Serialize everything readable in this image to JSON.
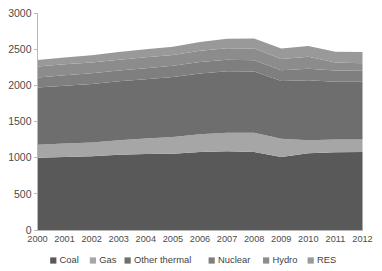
{
  "chart_data": {
    "type": "area",
    "stacked": true,
    "title": "",
    "subtitle": "",
    "xlabel": "",
    "ylabel": "",
    "grid": false,
    "legend_position": "bottom",
    "categories": [
      "2000",
      "2001",
      "2002",
      "2003",
      "2004",
      "2005",
      "2006",
      "2007",
      "2008",
      "2009",
      "2010",
      "2011",
      "2012"
    ],
    "x": [
      2000,
      2001,
      2002,
      2003,
      2004,
      2005,
      2006,
      2007,
      2008,
      2009,
      2010,
      2011,
      2012
    ],
    "xlim": [
      2000,
      2012
    ],
    "ylim": [
      0,
      3000
    ],
    "ytick_labels": [
      "0",
      "500",
      "1000",
      "1500",
      "2000",
      "2500",
      "3000"
    ],
    "yticks": [
      0,
      500,
      1000,
      1500,
      2000,
      2500,
      3000
    ],
    "series": [
      {
        "name": "Coal",
        "color": "#595959",
        "values": [
          1000,
          1010,
          1020,
          1040,
          1050,
          1055,
          1080,
          1090,
          1080,
          1010,
          1060,
          1075,
          1080
        ]
      },
      {
        "name": "Gas",
        "color": "#a6a6a6",
        "values": [
          180,
          185,
          190,
          200,
          215,
          230,
          245,
          255,
          265,
          250,
          180,
          175,
          170
        ]
      },
      {
        "name": "Other thermal",
        "color": "#6e6e6e",
        "values": [
          790,
          800,
          810,
          815,
          820,
          830,
          840,
          850,
          845,
          800,
          830,
          800,
          800
        ]
      },
      {
        "name": "Nuclear",
        "color": "#7f7f7f",
        "values": [
          140,
          145,
          148,
          150,
          152,
          155,
          158,
          160,
          158,
          150,
          160,
          155,
          150
        ]
      },
      {
        "name": "Hydro",
        "color": "#8c8c8c",
        "values": [
          150,
          150,
          148,
          150,
          152,
          150,
          155,
          158,
          160,
          155,
          165,
          110,
          105
        ]
      },
      {
        "name": "RES",
        "color": "#999999",
        "values": [
          90,
          95,
          100,
          105,
          110,
          115,
          120,
          130,
          140,
          145,
          150,
          150,
          155
        ]
      }
    ],
    "totals": [
      2350,
      2385,
      2416,
      2460,
      2499,
      2535,
      2598,
      2643,
      2648,
      2510,
      2545,
      2465,
      2460
    ]
  },
  "legend": {
    "items": [
      {
        "label": "Coal",
        "color": "#595959"
      },
      {
        "label": "Gas",
        "color": "#a6a6a6"
      },
      {
        "label": "Other thermal",
        "color": "#6e6e6e"
      },
      {
        "label": "Nuclear",
        "color": "#7f7f7f"
      },
      {
        "label": "Hydro",
        "color": "#8c8c8c"
      },
      {
        "label": "RES",
        "color": "#999999"
      }
    ]
  },
  "axes": {
    "y_max_label": "3000",
    "y_min_label": "0",
    "x_first_label": "2000",
    "x_last_label": "2012"
  }
}
